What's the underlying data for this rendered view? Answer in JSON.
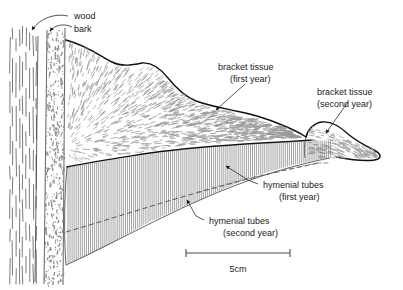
{
  "figure": {
    "title_visible": false,
    "background": "#ffffff",
    "ink": "#111111"
  },
  "labels": {
    "wood": "wood",
    "bark": "bark",
    "bracket_first_line1": "bracket tissue",
    "bracket_first_line2": "(first year)",
    "bracket_second_line1": "bracket tissue",
    "bracket_second_line2": "(second year)",
    "tubes_first_line1": "hymenial tubes",
    "tubes_first_line2": "(first year)",
    "tubes_second_line1": "hymenial tubes",
    "tubes_second_line2": "(second year)"
  },
  "scale": {
    "value": "5cm",
    "bar_start_x": 186,
    "bar_end_x": 290,
    "bar_y": 253
  },
  "regions": [
    {
      "name": "wood",
      "description": "vertical dashed grain at far left"
    },
    {
      "name": "bark",
      "description": "stippled vertical band"
    },
    {
      "name": "bracket-tissue-first-year",
      "description": "large radially-hatched fan body"
    },
    {
      "name": "bracket-tissue-second-year",
      "description": "small lobe at right tip"
    },
    {
      "name": "hymenial-tubes-first-year",
      "description": "vertical hatch band upper"
    },
    {
      "name": "hymenial-tubes-second-year",
      "description": "vertical hatch band below dashed line"
    }
  ]
}
